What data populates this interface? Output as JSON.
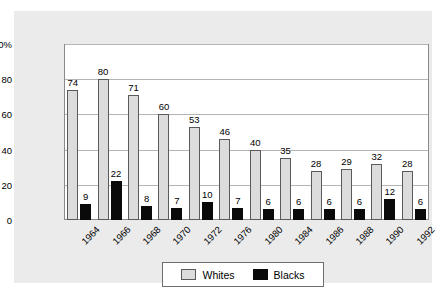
{
  "chart_data": {
    "type": "bar",
    "title": "",
    "subtitle": "",
    "xlabel": "",
    "ylabel": "",
    "ylim": [
      0,
      100
    ],
    "yticks": [
      "0",
      "20",
      "40",
      "60",
      "80",
      "100%"
    ],
    "ytick_values": [
      0,
      20,
      40,
      60,
      80,
      100
    ],
    "grid": true,
    "grid_axis": "y",
    "legend_position": "bottom-center",
    "categories": [
      "1964",
      "1966",
      "1968",
      "1970",
      "1972",
      "1976",
      "1980",
      "1984",
      "1986",
      "1988",
      "1990",
      "1992"
    ],
    "series": [
      {
        "name": "Whites",
        "color": "#dcdcdc",
        "values": [
          74,
          80,
          71,
          60,
          53,
          46,
          40,
          35,
          28,
          29,
          32,
          28
        ]
      },
      {
        "name": "Blacks",
        "color": "#0a0a0a",
        "values": [
          9,
          22,
          8,
          7,
          10,
          7,
          6,
          6,
          6,
          6,
          12,
          6
        ]
      }
    ]
  },
  "legend": {
    "items": [
      {
        "label": "Whites",
        "swatch": "whites-swatch"
      },
      {
        "label": "Blacks",
        "swatch": "blacks-swatch"
      }
    ]
  },
  "colors": {
    "page_background": "#ffffff",
    "panel_background": "#ebebeb",
    "plot_background": "#ffffff",
    "gridline": "#b4b4b4",
    "axis_line": "#8a8a8a",
    "whites_bar": "#dcdcdc",
    "whites_bar_border": "#5a5a5a",
    "blacks_bar": "#0a0a0a",
    "text": "#000000"
  }
}
